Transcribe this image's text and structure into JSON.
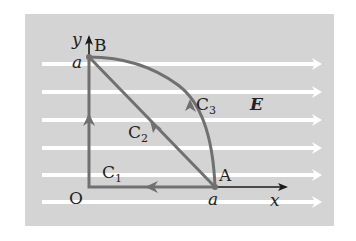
{
  "figure": {
    "colors": {
      "background_box": "#d4d4d4",
      "field_lines": "#ffffff",
      "paths": "#707070",
      "axes": "#1a1a1a",
      "text": "#222222"
    },
    "field": {
      "label": "E",
      "direction": "+x",
      "line_count": 6
    },
    "axes": {
      "x_label": "x",
      "y_label": "y",
      "origin_label": "O",
      "x_tick_label": "a",
      "y_tick_label": "a"
    },
    "points": {
      "A": {
        "label": "A",
        "coords": "(a, 0)"
      },
      "B": {
        "label": "B",
        "coords": "(0, a)"
      }
    },
    "paths": [
      {
        "name": "C",
        "sub": "1",
        "description": "A → O → B along the axes"
      },
      {
        "name": "C",
        "sub": "2",
        "description": "A → B along a straight line"
      },
      {
        "name": "C",
        "sub": "3",
        "description": "A → B along a circular arc"
      }
    ]
  }
}
